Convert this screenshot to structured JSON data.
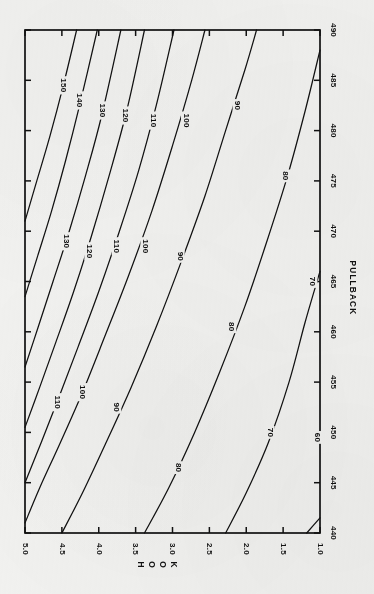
{
  "chart_data": {
    "type": "line",
    "subtype": "contour",
    "title": "",
    "orientation": "rotated-90-clockwise",
    "xlabel": "PULLBACK",
    "ylabel": "HOOK",
    "xlim": [
      440,
      490
    ],
    "ylim": [
      1.0,
      5.0
    ],
    "grid": false,
    "legend": "none",
    "xticks": [
      440,
      445,
      450,
      455,
      460,
      465,
      470,
      475,
      480,
      485,
      490
    ],
    "xtick_labels": [
      "440",
      "445",
      "450",
      "455",
      "460",
      "465",
      "470",
      "475",
      "480",
      "485",
      "490"
    ],
    "yticks": [
      1.0,
      1.5,
      2.0,
      2.5,
      3.0,
      3.5,
      4.0,
      4.5,
      5.0
    ],
    "ytick_labels": [
      "1.0",
      "1.5",
      "2.0",
      "2.5",
      "3.0",
      "3.5",
      "4.0",
      "4.5",
      "5.0"
    ],
    "contour_levels": [
      60,
      70,
      80,
      90,
      100,
      110,
      120,
      130,
      140,
      150
    ],
    "contours": [
      {
        "level": 60,
        "labels": [
          "60"
        ],
        "points": [
          [
            440.0,
            1.18
          ],
          [
            441.5,
            1.0
          ]
        ]
      },
      {
        "level": 70,
        "labels": [
          "70",
          "70"
        ],
        "points": [
          [
            440.0,
            2.28
          ],
          [
            444.0,
            2.0
          ],
          [
            449.0,
            1.7
          ],
          [
            455.0,
            1.42
          ],
          [
            461.0,
            1.2
          ],
          [
            466.0,
            1.0
          ]
        ]
      },
      {
        "level": 80,
        "labels": [
          "80",
          "80"
        ],
        "points": [
          [
            440.0,
            3.38
          ],
          [
            444.5,
            3.05
          ],
          [
            450.0,
            2.7
          ],
          [
            456.0,
            2.36
          ],
          [
            462.5,
            2.02
          ],
          [
            469.0,
            1.72
          ],
          [
            475.5,
            1.44
          ],
          [
            482.0,
            1.2
          ],
          [
            488.0,
            1.0
          ]
        ]
      },
      {
        "level": 90,
        "labels": [
          "90",
          "90",
          "90"
        ],
        "points": [
          [
            440.0,
            4.5
          ],
          [
            444.0,
            4.22
          ],
          [
            449.0,
            3.9
          ],
          [
            454.5,
            3.56
          ],
          [
            460.5,
            3.22
          ],
          [
            467.0,
            2.88
          ],
          [
            473.5,
            2.56
          ],
          [
            480.0,
            2.28
          ],
          [
            486.0,
            2.02
          ],
          [
            490.0,
            1.86
          ]
        ]
      },
      {
        "level": 100,
        "labels": [
          "100",
          "100",
          "100"
        ],
        "points": [
          [
            441.0,
            5.0
          ],
          [
            444.5,
            4.8
          ],
          [
            449.0,
            4.52
          ],
          [
            454.0,
            4.22
          ],
          [
            459.5,
            3.92
          ],
          [
            465.5,
            3.6
          ],
          [
            472.0,
            3.28
          ],
          [
            478.5,
            3.0
          ],
          [
            485.0,
            2.74
          ],
          [
            490.0,
            2.56
          ]
        ]
      },
      {
        "level": 110,
        "labels": [
          "110",
          "110",
          "110"
        ],
        "points": [
          [
            445.0,
            5.0
          ],
          [
            449.0,
            4.78
          ],
          [
            453.5,
            4.54
          ],
          [
            458.5,
            4.28
          ],
          [
            464.0,
            4.0
          ],
          [
            470.0,
            3.72
          ],
          [
            476.0,
            3.46
          ],
          [
            482.5,
            3.22
          ],
          [
            490.0,
            2.98
          ]
        ]
      },
      {
        "level": 120,
        "labels": [
          "120",
          "120"
        ],
        "points": [
          [
            450.5,
            5.0
          ],
          [
            454.5,
            4.8
          ],
          [
            459.0,
            4.58
          ],
          [
            464.0,
            4.34
          ],
          [
            469.5,
            4.1
          ],
          [
            475.5,
            3.86
          ],
          [
            482.0,
            3.62
          ],
          [
            490.0,
            3.38
          ]
        ]
      },
      {
        "level": 130,
        "labels": [
          "130",
          "130"
        ],
        "points": [
          [
            456.5,
            5.0
          ],
          [
            460.5,
            4.82
          ],
          [
            465.0,
            4.62
          ],
          [
            470.0,
            4.4
          ],
          [
            475.5,
            4.18
          ],
          [
            481.5,
            3.96
          ],
          [
            490.0,
            3.7
          ]
        ]
      },
      {
        "level": 140,
        "labels": [
          "140"
        ],
        "points": [
          [
            463.5,
            5.0
          ],
          [
            467.5,
            4.83
          ],
          [
            472.0,
            4.64
          ],
          [
            477.0,
            4.45
          ],
          [
            482.5,
            4.26
          ],
          [
            490.0,
            4.02
          ]
        ]
      },
      {
        "level": 150,
        "labels": [
          "150"
        ],
        "points": [
          [
            471.0,
            5.0
          ],
          [
            475.0,
            4.84
          ],
          [
            479.5,
            4.66
          ],
          [
            484.5,
            4.48
          ],
          [
            490.0,
            4.3
          ]
        ]
      }
    ],
    "contour_label_positions": [
      {
        "level": 150,
        "x": 484.5,
        "y": 4.48
      },
      {
        "level": 140,
        "x": 483.0,
        "y": 4.26
      },
      {
        "level": 130,
        "x": 482.0,
        "y": 3.96
      },
      {
        "level": 130,
        "x": 469.0,
        "y": 4.44
      },
      {
        "level": 120,
        "x": 481.5,
        "y": 3.64
      },
      {
        "level": 120,
        "x": 468.0,
        "y": 4.13
      },
      {
        "level": 110,
        "x": 481.0,
        "y": 3.26
      },
      {
        "level": 110,
        "x": 468.5,
        "y": 3.76
      },
      {
        "level": 110,
        "x": 453.0,
        "y": 4.57
      },
      {
        "level": 100,
        "x": 481.0,
        "y": 2.82
      },
      {
        "level": 100,
        "x": 468.5,
        "y": 3.37
      },
      {
        "level": 100,
        "x": 454.0,
        "y": 4.22
      },
      {
        "level": 90,
        "x": 482.5,
        "y": 2.12
      },
      {
        "level": 90,
        "x": 467.5,
        "y": 2.9
      },
      {
        "level": 90,
        "x": 452.5,
        "y": 3.76
      },
      {
        "level": 80,
        "x": 475.5,
        "y": 1.47
      },
      {
        "level": 80,
        "x": 460.5,
        "y": 2.2
      },
      {
        "level": 80,
        "x": 446.5,
        "y": 2.93
      },
      {
        "level": 70,
        "x": 465.0,
        "y": 1.1
      },
      {
        "level": 70,
        "x": 450.0,
        "y": 1.68
      },
      {
        "level": 60,
        "x": 449.5,
        "y": 1.04
      }
    ]
  },
  "axes": {
    "x": {
      "name": "PULLBACK",
      "ticks": [
        "440",
        "445",
        "450",
        "455",
        "460",
        "465",
        "470",
        "475",
        "480",
        "485",
        "490"
      ]
    },
    "y": {
      "name": "HOOK",
      "ticks": [
        "5.0",
        "4.5",
        "4.0",
        "3.5",
        "3.0",
        "2.5",
        "2.0",
        "1.5",
        "1.0"
      ]
    }
  },
  "style": {
    "ink": "#111111",
    "paper": "#f1f1ef",
    "frame": "#111111"
  }
}
